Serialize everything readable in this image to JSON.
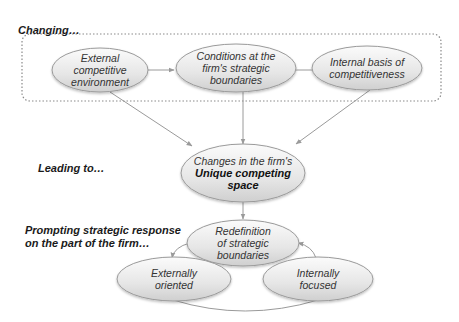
{
  "labels": {
    "changing": "Changing…",
    "leading": "Leading to…",
    "prompting_line1": "Prompting strategic response",
    "prompting_line2": "on the part of the firm…"
  },
  "nodes": {
    "external": {
      "line1": "External",
      "line2": "competitive",
      "line3": "environment"
    },
    "conditions": {
      "line1": "Conditions at the",
      "line2": "firm's strategic",
      "line3": "boundaries"
    },
    "internal": {
      "line1": "Internal basis of",
      "line2": "competitiveness"
    },
    "changes": {
      "line1": "Changes in the firm's",
      "line2": "Unique competing",
      "line3": "space"
    },
    "redefinition": {
      "line1": "Redefinition",
      "line2": "of strategic",
      "line3": "boundaries"
    },
    "externally": {
      "line1": "Externally",
      "line2": "oriented"
    },
    "internally": {
      "line1": "Internally",
      "line2": "focused"
    }
  },
  "colors": {
    "ellipse_fill_top": "#f7f7f7",
    "ellipse_fill_bottom": "#d4d4d4",
    "stroke": "#9a9a9a",
    "dashed_border": "#8a8a8a",
    "text": "#333333"
  }
}
